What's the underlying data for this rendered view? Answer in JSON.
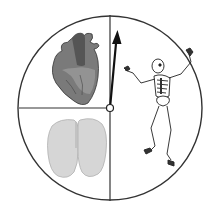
{
  "diagram": {
    "type": "spinner",
    "center": [
      110,
      108
    ],
    "radius": 92,
    "sections": [
      {
        "id": "heart",
        "label": "heart",
        "position": "upper-left"
      },
      {
        "id": "lungs",
        "label": "lungs",
        "position": "lower-left"
      },
      {
        "id": "skeleton",
        "label": "skeleton",
        "position": "right-half"
      }
    ],
    "pointer": {
      "points_to": "boundary between heart and skeleton (slightly into skeleton)",
      "tip": [
        117,
        30
      ]
    },
    "colors": {
      "line": "#333333",
      "heart": "#6e6e6e",
      "lungs": "#cfcfcf",
      "skeleton": "#ffffff"
    }
  }
}
